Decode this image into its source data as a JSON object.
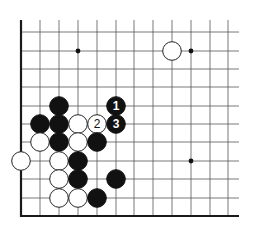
{
  "board": {
    "title": "Go board corner diagram",
    "columns_x": [
      21,
      40,
      59,
      78,
      97,
      116,
      134,
      153,
      172,
      191,
      210,
      228
    ],
    "rows_y": [
      32,
      51,
      69,
      87,
      106,
      124,
      142,
      161,
      179,
      198,
      216
    ],
    "line_start_y": 20,
    "line_end_x": 239,
    "left_edge_x": 21,
    "bottom_edge_y": 216,
    "stone_radius": 9.3,
    "colors": {
      "black": "#111111",
      "white": "#ffffff",
      "grid": "#555555",
      "edge": "#1a1a1a"
    },
    "star_points": [
      {
        "col": 3,
        "row": 1
      },
      {
        "col": 9,
        "row": 1
      },
      {
        "col": 9,
        "row": 7
      }
    ],
    "stones": [
      {
        "color": "white",
        "col": 8,
        "row": 1,
        "label": ""
      },
      {
        "color": "black",
        "col": 2,
        "row": 4,
        "label": ""
      },
      {
        "color": "black",
        "col": 5,
        "row": 4,
        "label": "1"
      },
      {
        "color": "black",
        "col": 1,
        "row": 5,
        "label": ""
      },
      {
        "color": "black",
        "col": 2,
        "row": 5,
        "label": ""
      },
      {
        "color": "white",
        "col": 3,
        "row": 5,
        "label": ""
      },
      {
        "color": "white",
        "col": 4,
        "row": 5,
        "label": "2"
      },
      {
        "color": "black",
        "col": 5,
        "row": 5,
        "label": "3"
      },
      {
        "color": "white",
        "col": 1,
        "row": 6,
        "label": ""
      },
      {
        "color": "black",
        "col": 2,
        "row": 6,
        "label": ""
      },
      {
        "color": "white",
        "col": 3,
        "row": 6,
        "label": ""
      },
      {
        "color": "black",
        "col": 4,
        "row": 6,
        "label": ""
      },
      {
        "color": "white",
        "col": 0,
        "row": 7,
        "label": ""
      },
      {
        "color": "white",
        "col": 2,
        "row": 7,
        "label": ""
      },
      {
        "color": "black",
        "col": 3,
        "row": 7,
        "label": ""
      },
      {
        "color": "white",
        "col": 2,
        "row": 8,
        "label": ""
      },
      {
        "color": "black",
        "col": 3,
        "row": 8,
        "label": ""
      },
      {
        "color": "black",
        "col": 5,
        "row": 8,
        "label": ""
      },
      {
        "color": "white",
        "col": 2,
        "row": 9,
        "label": ""
      },
      {
        "color": "white",
        "col": 3,
        "row": 9,
        "label": ""
      },
      {
        "color": "black",
        "col": 4,
        "row": 9,
        "label": ""
      }
    ],
    "move_labels": [
      {
        "number": "1",
        "color": "black"
      },
      {
        "number": "2",
        "color": "white"
      },
      {
        "number": "3",
        "color": "black"
      }
    ]
  }
}
